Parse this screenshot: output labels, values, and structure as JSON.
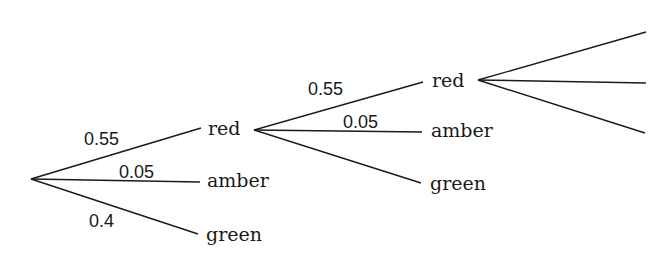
{
  "diagram": {
    "type": "probability-tree",
    "line_color": "#1a1a1a",
    "levels": [
      {
        "branches": [
          {
            "outcome": "red",
            "probability": "0.55"
          },
          {
            "outcome": "amber",
            "probability": "0.05"
          },
          {
            "outcome": "green",
            "probability": "0.4"
          }
        ]
      },
      {
        "parent": "red",
        "branches": [
          {
            "outcome": "red",
            "probability": "0.55"
          },
          {
            "outcome": "amber",
            "probability": "0.05"
          },
          {
            "outcome": "green",
            "probability": ""
          }
        ]
      },
      {
        "parent": "red",
        "branches": [
          {
            "outcome": "",
            "probability": ""
          },
          {
            "outcome": "",
            "probability": ""
          },
          {
            "outcome": "",
            "probability": ""
          }
        ]
      }
    ]
  }
}
